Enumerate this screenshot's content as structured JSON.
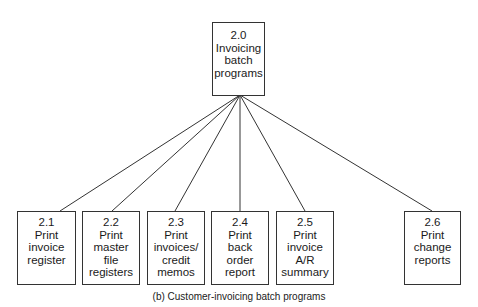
{
  "root": {
    "id": "2.0",
    "lines": [
      "2.0",
      "Invoicing",
      "batch",
      "programs"
    ]
  },
  "children": [
    {
      "id": "2.1",
      "lines": [
        "2.1",
        "Print",
        "invoice",
        "register"
      ]
    },
    {
      "id": "2.2",
      "lines": [
        "2.2",
        "Print",
        "master",
        "file",
        "registers"
      ]
    },
    {
      "id": "2.3",
      "lines": [
        "2.3",
        "Print",
        "invoices/",
        "credit",
        "memos"
      ]
    },
    {
      "id": "2.4",
      "lines": [
        "2.4",
        "Print",
        "back",
        "order",
        "report"
      ]
    },
    {
      "id": "2.5",
      "lines": [
        "2.5",
        "Print",
        "invoice",
        "A/R",
        "summary"
      ]
    },
    {
      "id": "2.6",
      "lines": [
        "2.6",
        "Print",
        "change",
        "reports"
      ]
    }
  ],
  "caption": "(b) Customer-invoicing batch programs",
  "colors": {
    "line": "#333333",
    "text": "#1a1a1a",
    "background": "#ffffff"
  }
}
